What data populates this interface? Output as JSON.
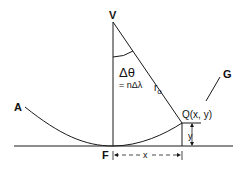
{
  "diagram": {
    "type": "geometry-construction",
    "labels": {
      "vertex": "V",
      "foot": "F",
      "curve_start": "A",
      "curve_end": "G",
      "point": "Q(x, y)",
      "radius": "r",
      "radius_subscript": "o",
      "angle_symbol": "Δθ",
      "angle_equation": "= nΔλ",
      "x_dimension": "x",
      "y_dimension": "y"
    },
    "colors": {
      "stroke": "#1a1a1a",
      "background": "#ffffff"
    }
  }
}
